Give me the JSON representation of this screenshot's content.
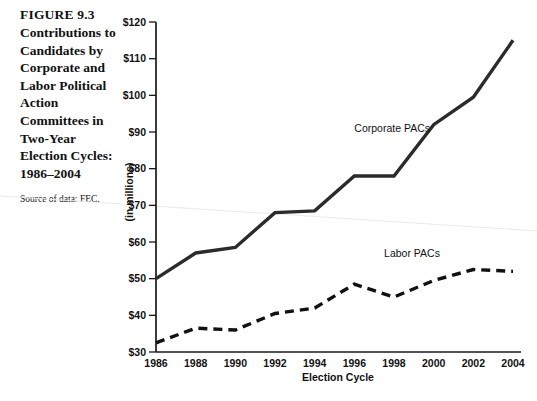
{
  "figure": {
    "number": "FIGURE 9.3",
    "title": "Contributions to Candidates by Corporate and Labor Political Action Committees in Two-Year Election Cycles: 1986–2004",
    "source": "Source of data: FEC."
  },
  "chart_data": {
    "type": "line",
    "title": "",
    "xlabel": "Election Cycle",
    "ylabel": "(in millions)",
    "categories": [
      "1986",
      "1988",
      "1990",
      "1992",
      "1994",
      "1996",
      "1998",
      "2000",
      "2002",
      "2004"
    ],
    "x": [
      1986,
      1988,
      1990,
      1992,
      1994,
      1996,
      1998,
      2000,
      2002,
      2004
    ],
    "xlim": [
      1986,
      2004
    ],
    "ylim": [
      30,
      120
    ],
    "ytick_labels": [
      "$30",
      "$40",
      "$50",
      "$60",
      "$70",
      "$80",
      "$90",
      "$100",
      "$110",
      "$120"
    ],
    "ytick_values": [
      30,
      40,
      50,
      60,
      70,
      80,
      90,
      100,
      110,
      120
    ],
    "grid": false,
    "legend_position": "inline-annotations",
    "series": [
      {
        "name": "Corporate PACs",
        "style": "solid",
        "color": "#2b2b2b",
        "values": [
          50,
          57,
          58.5,
          68,
          68.5,
          78,
          78,
          92,
          99.5,
          115
        ]
      },
      {
        "name": "Labor PACs",
        "style": "dashed",
        "color": "#111111",
        "values": [
          32.5,
          36.5,
          36,
          40.5,
          42,
          48.5,
          45,
          49.5,
          52.5,
          52
        ]
      }
    ],
    "annotations": [
      {
        "text": "Corporate PACs",
        "x": 1996,
        "y": 90
      },
      {
        "text": "Labor PACs",
        "x": 1997.5,
        "y": 56
      }
    ]
  }
}
